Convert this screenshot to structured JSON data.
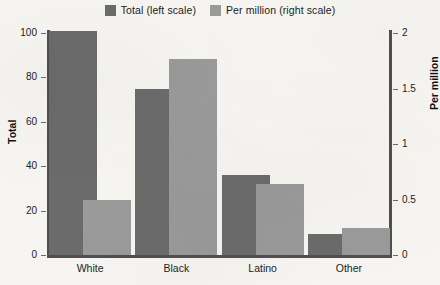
{
  "chart_data": {
    "type": "bar",
    "title": "",
    "categories": [
      "White",
      "Black",
      "Latino",
      "Other"
    ],
    "series": [
      {
        "name": "Total (left scale)",
        "axis": "left",
        "color": "#6b6b6b",
        "values": [
          101,
          75,
          36,
          9.5
        ]
      },
      {
        "name": "Per million (right scale)",
        "axis": "right",
        "color": "#9a9a9a",
        "values": [
          0.5,
          1.77,
          0.64,
          0.24
        ]
      }
    ],
    "xlabel": "",
    "ylabel": "Total",
    "y2label": "Per million",
    "ylim": [
      0,
      100
    ],
    "y2lim": [
      0,
      2
    ],
    "yticks": [
      "0",
      "20",
      "40",
      "60",
      "80",
      "100"
    ],
    "ytick_values": [
      0,
      20,
      40,
      60,
      80,
      100
    ],
    "y2ticks": [
      "0",
      "0.5",
      "1",
      "1.5",
      "2"
    ],
    "y2tick_values": [
      0,
      0.5,
      1,
      1.5,
      2
    ],
    "grid": false,
    "legend_position": "top-center"
  },
  "legend": {
    "items": [
      {
        "label": "Total (left scale)",
        "color": "#6b6b6b"
      },
      {
        "label": "Per million (right scale)",
        "color": "#9a9a9a"
      }
    ]
  },
  "axes": {
    "left_title": "Total",
    "right_title": "Per million"
  },
  "colors": {
    "background": "#f6f5f2",
    "axis": "#4f4f4f",
    "text": "#1c1c1c",
    "bar_total": "#6b6b6b",
    "bar_permillion": "#9a9a9a"
  }
}
